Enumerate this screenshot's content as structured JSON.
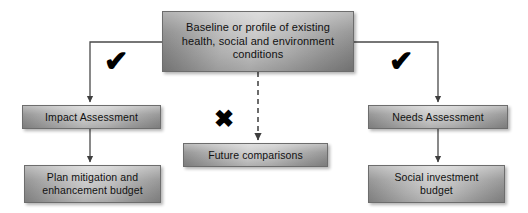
{
  "diagram": {
    "background_color": "#ffffff",
    "node_border_color": "#6d6d6d",
    "connector_color": "#4a4a4a",
    "mark_color": "#000000",
    "nodes": {
      "baseline": {
        "label": "Baseline or profile of existing\nhealth, social and environment\nconditions",
        "role": "source"
      },
      "impact_assessment": {
        "label": "Impact Assessment",
        "role": "branch-left"
      },
      "plan_mitigation": {
        "label": "Plan mitigation and\nenhancement budget",
        "role": "branch-left-outcome"
      },
      "needs_assessment": {
        "label": "Needs Assessment",
        "role": "branch-right"
      },
      "social_investment": {
        "label": "Social investment\nbudget",
        "role": "branch-right-outcome"
      },
      "future_comparisons": {
        "label": "Future comparisons",
        "role": "branch-middle"
      }
    },
    "marks": {
      "check_left": {
        "glyph": "✔",
        "icon": "check-icon",
        "meaning": "supported branch"
      },
      "check_right": {
        "glyph": "✔",
        "icon": "check-icon",
        "meaning": "supported branch"
      },
      "cross_middle": {
        "glyph": "✖",
        "icon": "cross-icon",
        "meaning": "not supported branch"
      }
    },
    "connectors": [
      {
        "name": "baseline-to-impact-assessment",
        "style": "solid",
        "arrow": true
      },
      {
        "name": "impact-assessment-to-plan-mitigation",
        "style": "solid",
        "arrow": true
      },
      {
        "name": "baseline-to-needs-assessment",
        "style": "solid",
        "arrow": true
      },
      {
        "name": "needs-assessment-to-social-investment",
        "style": "solid",
        "arrow": true
      },
      {
        "name": "baseline-to-future-comparisons",
        "style": "dashed",
        "arrow": true
      }
    ]
  }
}
